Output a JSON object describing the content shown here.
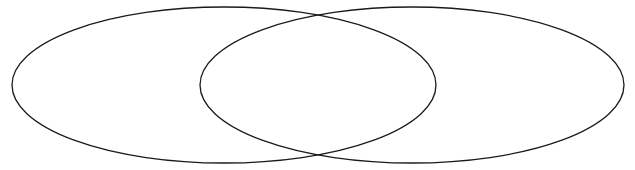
{
  "diagram": {
    "type": "venn",
    "background_color": "#ffffff",
    "stroke_color": "#1a1a1a",
    "stroke_width": 1.3,
    "sets": [
      {
        "id": "left",
        "label": "",
        "cx": 224,
        "cy": 85,
        "rx": 212,
        "ry": 78
      },
      {
        "id": "right",
        "label": "",
        "cx": 412,
        "cy": 85,
        "rx": 212,
        "ry": 78
      }
    ]
  }
}
